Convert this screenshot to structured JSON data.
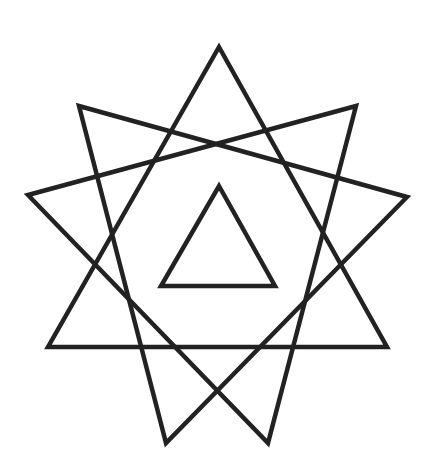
{
  "figure": {
    "background": "#ffffff",
    "stroke_color": "#222222",
    "stroke_width": 4.5,
    "shapes": [
      {
        "name": "triangle-upright",
        "points": [
          [
            219,
            47
          ],
          [
            387,
            347
          ],
          [
            48,
            347
          ]
        ]
      },
      {
        "name": "triangle-rotated-right",
        "points": [
          [
            79,
            106
          ],
          [
            407,
            197
          ],
          [
            166,
            443
          ]
        ]
      },
      {
        "name": "triangle-rotated-left",
        "points": [
          [
            356,
            106
          ],
          [
            268,
            443
          ],
          [
            28,
            195
          ]
        ]
      },
      {
        "name": "inner-triangle",
        "points": [
          [
            219,
            186
          ],
          [
            275,
            286
          ],
          [
            161,
            286
          ]
        ]
      }
    ]
  }
}
